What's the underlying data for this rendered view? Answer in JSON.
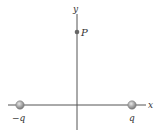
{
  "axes": {
    "x_label": "x",
    "y_label": "y",
    "color": "#555555"
  },
  "point": {
    "label": "P",
    "color": "#666666"
  },
  "charges": [
    {
      "label": "−q",
      "color": "#a0a0a0"
    },
    {
      "label": "q",
      "color": "#a0a0a0"
    }
  ]
}
